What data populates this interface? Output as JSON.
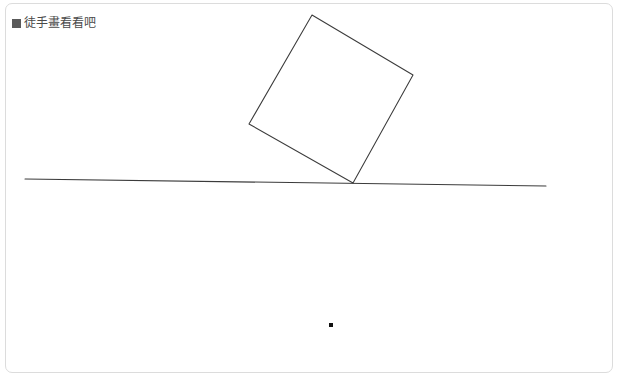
{
  "panel": {
    "bullet_icon": "filled-square-bullet",
    "title": "徒手畫看看吧",
    "background_color": "#ffffff",
    "border_color": "#dcdcdc",
    "title_color": "#4a4a4a",
    "bullet_color": "#5a5a5a"
  },
  "drawing": {
    "ink_color": "#3b3b3b",
    "dot_color": "#111111",
    "stroke_width": 1.05,
    "shapes": [
      {
        "name": "tilted-square",
        "type": "polygon",
        "points": "306,11 407,71 347,179 243,120",
        "closed": true
      },
      {
        "name": "ground-line",
        "type": "polyline",
        "points": "19,175 540,182",
        "closed": false
      }
    ],
    "dots": [
      {
        "name": "stray-ink-dot",
        "x": 323,
        "y": 319,
        "size": 4
      }
    ]
  }
}
